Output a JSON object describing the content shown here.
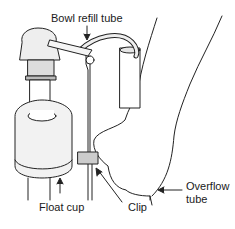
{
  "diagram": {
    "type": "illustration",
    "labels": {
      "bowl_refill_tube": "Bowl refill tube",
      "float_cup": "Float cup",
      "clip": "Clip",
      "overflow_tube_line1": "Overflow",
      "overflow_tube_line2": "tube"
    },
    "colors": {
      "line": "#222222",
      "fill_light": "#f2f2f2",
      "fill_mid": "#d9d9d9",
      "fill_dark": "#b5b5b5"
    }
  }
}
